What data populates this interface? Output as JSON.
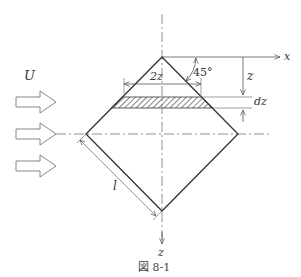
{
  "figure": {
    "caption": "図 8-1",
    "labels": {
      "flow_velocity": "U",
      "x_axis": "x",
      "z_axis": "z",
      "width": "2z",
      "depth": "z",
      "strip_thickness": "dz",
      "angle": "45°",
      "side_length": "l"
    },
    "flow_arrows": 3,
    "colors": {
      "line": "#333333",
      "dimension_line": "#777777",
      "axis_line": "#666666",
      "background": "#ffffff"
    }
  }
}
